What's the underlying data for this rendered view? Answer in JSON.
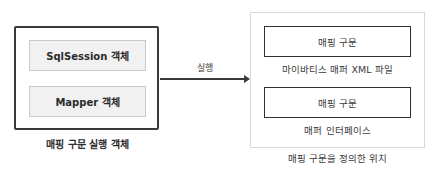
{
  "left_group": {
    "items": [
      {
        "label": "SqlSession 객체"
      },
      {
        "label": "Mapper 객체"
      }
    ],
    "caption": "매핑 구문 실행 객체"
  },
  "arrow": {
    "label": "실행"
  },
  "right_group": {
    "items": [
      {
        "box_label": "매핑 구문",
        "sublabel": "마이바티스 매퍼 XML 파일"
      },
      {
        "box_label": "매핑 구문",
        "sublabel": "매퍼 인터페이스"
      }
    ],
    "caption": "매핑 구문을 정의한 위치"
  },
  "colors": {
    "outer_border_dark": "#3a3a3a",
    "inner_fill_gray": "#f1f1f1",
    "right_outer_border": "#d8d8d8",
    "text": "#2b2b2b"
  }
}
